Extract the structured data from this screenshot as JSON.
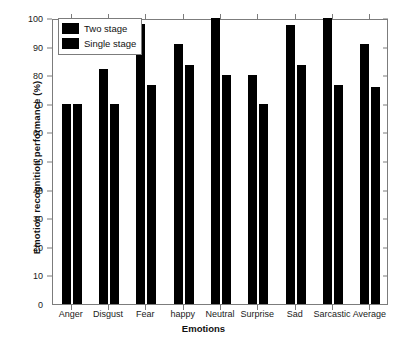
{
  "chart_data": {
    "type": "bar",
    "title": "",
    "xlabel": "Emotions",
    "ylabel": "Emotion recognition performance (%)",
    "categories": [
      "Anger",
      "Disgust",
      "Fear",
      "happy",
      "Neutral",
      "Surprise",
      "Sad",
      "Sarcastic",
      "Average"
    ],
    "series": [
      {
        "name": "Two stage",
        "color": "#000000",
        "values": [
          70,
          82,
          98,
          91,
          100,
          80,
          97.5,
          100,
          91
        ]
      },
      {
        "name": "Single stage",
        "color": "#000000",
        "values": [
          70,
          70,
          76.5,
          83.5,
          80,
          70,
          83.5,
          76.5,
          76
        ]
      }
    ],
    "ylim": [
      0,
      100
    ],
    "ytick_labels": [
      "0",
      "10",
      "20",
      "30",
      "40",
      "50",
      "60",
      "70",
      "80",
      "90",
      "100"
    ],
    "ytick_values": [
      0,
      10,
      20,
      30,
      40,
      50,
      60,
      70,
      80,
      90,
      100
    ],
    "grid": false,
    "legend_position": "top-left"
  },
  "legend": {
    "entries": [
      {
        "label": "Two stage"
      },
      {
        "label": "Single stage"
      }
    ]
  }
}
